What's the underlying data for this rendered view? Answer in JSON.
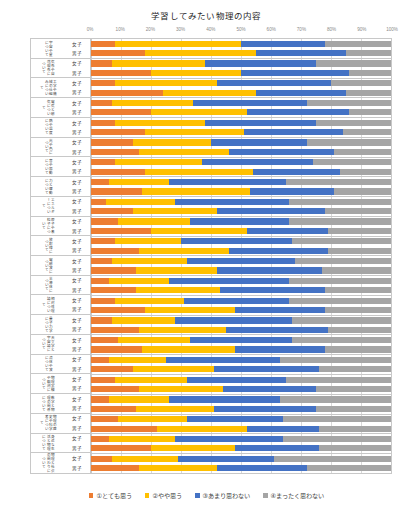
{
  "chart_data": {
    "type": "bar",
    "subtype": "100%-stacked-horizontal",
    "title": "学習してみたい物理の内容",
    "xlabel": "",
    "ylabel": "",
    "xlim": [
      0,
      100
    ],
    "xticks": [
      "0%",
      "10%",
      "20%",
      "30%",
      "40%",
      "50%",
      "60%",
      "70%",
      "80%",
      "90%",
      "100%"
    ],
    "grid": true,
    "legend_position": "bottom",
    "series": [
      {
        "name": "①とても思う",
        "color": "#ED7D31"
      },
      {
        "name": "②やや思う",
        "color": "#FFC000"
      },
      {
        "name": "③あまり思わない",
        "color": "#4472C4"
      },
      {
        "name": "④まったく思わない",
        "color": "#A5A5A5"
      }
    ],
    "subcategories": [
      "女子",
      "男子"
    ],
    "categories": [
      {
        "label": "宇宙や星について",
        "rows": [
          {
            "sex": "女子",
            "values": [
              8,
              42,
              28,
              22
            ]
          },
          {
            "sex": "男子",
            "values": [
              18,
              37,
              30,
              15
            ]
          }
        ]
      },
      {
        "label": "気象や自然現象について",
        "rows": [
          {
            "sex": "女子",
            "values": [
              7,
              31,
              37,
              25
            ]
          },
          {
            "sex": "男子",
            "values": [
              20,
              30,
              36,
              14
            ]
          }
        ]
      },
      {
        "label": "工学や機械の仕組みについて",
        "rows": [
          {
            "sex": "女子",
            "values": [
              8,
              34,
              38,
              20
            ]
          },
          {
            "sex": "男子",
            "values": [
              24,
              31,
              30,
              15
            ]
          }
        ]
      },
      {
        "label": "電気と磁気について",
        "rows": [
          {
            "sex": "女子",
            "values": [
              7,
              27,
              38,
              28
            ]
          },
          {
            "sex": "男子",
            "values": [
              20,
              32,
              34,
              14
            ]
          }
        ]
      },
      {
        "label": "熱や温度について",
        "rows": [
          {
            "sex": "女子",
            "values": [
              8,
              30,
              37,
              25
            ]
          },
          {
            "sex": "男子",
            "values": [
              18,
              33,
              33,
              16
            ]
          }
        ]
      },
      {
        "label": "光や色について",
        "rows": [
          {
            "sex": "女子",
            "values": [
              14,
              26,
              32,
              28
            ]
          },
          {
            "sex": "男子",
            "values": [
              16,
              30,
              35,
              19
            ]
          }
        ]
      },
      {
        "label": "音や振動について",
        "rows": [
          {
            "sex": "女子",
            "values": [
              8,
              29,
              37,
              26
            ]
          },
          {
            "sex": "男子",
            "values": [
              18,
              36,
              29,
              17
            ]
          }
        ]
      },
      {
        "label": "力と運動について",
        "rows": [
          {
            "sex": "女子",
            "values": [
              6,
              20,
              39,
              35
            ]
          },
          {
            "sex": "男子",
            "values": [
              17,
              36,
              28,
              19
            ]
          }
        ]
      },
      {
        "label": "エネルギーについて",
        "rows": [
          {
            "sex": "女子",
            "values": [
              5,
              23,
              38,
              34
            ]
          },
          {
            "sex": "男子",
            "values": [
              14,
              28,
              36,
              22
            ]
          }
        ]
      },
      {
        "label": "原子や素粒子について",
        "rows": [
          {
            "sex": "女子",
            "values": [
              9,
              24,
              33,
              34
            ]
          },
          {
            "sex": "男子",
            "values": [
              20,
              32,
              27,
              21
            ]
          }
        ]
      },
      {
        "label": "放射線について",
        "rows": [
          {
            "sex": "女子",
            "values": [
              8,
              22,
              37,
              33
            ]
          },
          {
            "sex": "男子",
            "values": [
              16,
              30,
              33,
              21
            ]
          }
        ]
      },
      {
        "label": "電磁波について",
        "rows": [
          {
            "sex": "女子",
            "values": [
              7,
              25,
              36,
              32
            ]
          },
          {
            "sex": "男子",
            "values": [
              15,
              27,
              35,
              23
            ]
          }
        ]
      },
      {
        "label": "半導体について",
        "rows": [
          {
            "sex": "女子",
            "values": [
              6,
              20,
              40,
              34
            ]
          },
          {
            "sex": "男子",
            "values": [
              15,
              28,
              35,
              22
            ]
          }
        ]
      },
      {
        "label": "相対性理論について",
        "rows": [
          {
            "sex": "女子",
            "values": [
              8,
              23,
              35,
              34
            ]
          },
          {
            "sex": "男子",
            "values": [
              18,
              30,
              30,
              22
            ]
          }
        ]
      },
      {
        "label": "量子力学について",
        "rows": [
          {
            "sex": "女子",
            "values": [
              7,
              21,
              39,
              33
            ]
          },
          {
            "sex": "男子",
            "values": [
              16,
              29,
              34,
              21
            ]
          }
        ]
      },
      {
        "label": "天文学と宇宙論について",
        "rows": [
          {
            "sex": "女子",
            "values": [
              9,
              24,
              34,
              33
            ]
          },
          {
            "sex": "男子",
            "values": [
              17,
              31,
              30,
              22
            ]
          }
        ]
      },
      {
        "label": "流体や波について",
        "rows": [
          {
            "sex": "女子",
            "values": [
              6,
              19,
              38,
              37
            ]
          },
          {
            "sex": "男子",
            "values": [
              14,
              27,
              35,
              24
            ]
          }
        ]
      },
      {
        "label": "物理実験や観測について",
        "rows": [
          {
            "sex": "女子",
            "values": [
              8,
              24,
              33,
              35
            ]
          },
          {
            "sex": "男子",
            "values": [
              16,
              28,
              31,
              25
            ]
          }
        ]
      },
      {
        "label": "数学と物理の関係について",
        "rows": [
          {
            "sex": "女子",
            "values": [
              6,
              20,
              37,
              37
            ]
          },
          {
            "sex": "男子",
            "values": [
              15,
              26,
              34,
              25
            ]
          }
        ]
      },
      {
        "label": "物理の歴史や科学者について",
        "rows": [
          {
            "sex": "女子",
            "values": [
              9,
              23,
              32,
              36
            ]
          },
          {
            "sex": "男子",
            "values": [
              22,
              30,
              24,
              24
            ]
          }
        ]
      },
      {
        "label": "身近な生活と物理について",
        "rows": [
          {
            "sex": "女子",
            "values": [
              6,
              22,
              36,
              36
            ]
          },
          {
            "sex": "男子",
            "values": [
              20,
              28,
              28,
              24
            ]
          }
        ]
      },
      {
        "label": "物理と社会の関わりについて",
        "rows": [
          {
            "sex": "女子",
            "values": [
              7,
              22,
              32,
              39
            ]
          },
          {
            "sex": "男子",
            "values": [
              16,
              26,
              30,
              28
            ]
          }
        ]
      }
    ]
  }
}
